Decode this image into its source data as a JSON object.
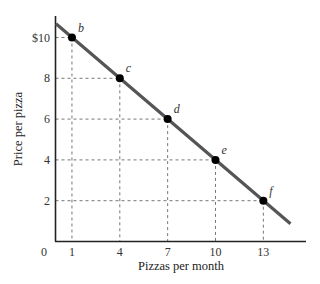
{
  "chart_data": {
    "type": "line",
    "title": "",
    "xlabel": "Pizzas per month",
    "ylabel": "Price per pizza",
    "x_ticks": [
      "0",
      "1",
      "4",
      "7",
      "10",
      "13"
    ],
    "y_ticks": [
      "2",
      "4",
      "6",
      "8",
      "$10"
    ],
    "xlim": [
      0,
      15.5
    ],
    "ylim": [
      0,
      11
    ],
    "grid": false,
    "legend": null,
    "series": [
      {
        "name": "Demand curve",
        "color": "#555555",
        "points": [
          {
            "label": "b",
            "x": 1,
            "y": 10
          },
          {
            "label": "c",
            "x": 4,
            "y": 8
          },
          {
            "label": "d",
            "x": 7,
            "y": 6
          },
          {
            "label": "e",
            "x": 10,
            "y": 4
          },
          {
            "label": "f",
            "x": 13,
            "y": 2
          }
        ],
        "line_extent": {
          "x_start": 0,
          "y_start": 10.67,
          "x_end": 14.7,
          "y_end": 0.87
        }
      }
    ],
    "annotations": "Dashed guide lines drop from each labeled point to both axes"
  },
  "colors": {
    "line": "#555555",
    "axis": "#222222",
    "dash": "#777777",
    "point": "#000000"
  }
}
